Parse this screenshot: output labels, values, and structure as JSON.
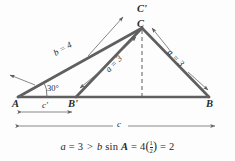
{
  "figure": {
    "type": "geometry-diagram",
    "background_color": "#fdfdfd",
    "line_color": "#555555",
    "text_color": "#2a2a2a",
    "points": {
      "A": "A",
      "B": "B",
      "B_prime": "B'",
      "C": "C",
      "C_prime": "C'"
    },
    "side_labels": {
      "b": "b = 4",
      "a_right": "a = 3",
      "a_inner": "a = 3"
    },
    "angle_label": "30°",
    "dimension_labels": {
      "c_prime": "c'",
      "c": "c"
    }
  },
  "formula": {
    "a_symbol": "a",
    "eq1": "=",
    "a_value": "3",
    "gt": ">",
    "b_symbol": "b",
    "sin": "sin",
    "A_symbol": "A",
    "eq2": "=",
    "b_value": "4",
    "frac_num": "1",
    "frac_den": "2",
    "eq3": "=",
    "result": "2",
    "plain": "a = 3 > b sin A = 4 (1/2) = 2"
  }
}
